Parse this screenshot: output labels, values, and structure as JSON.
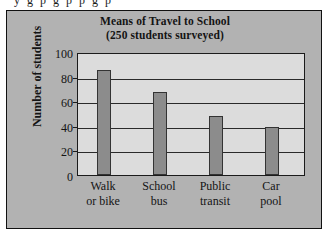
{
  "page": {
    "cut_off_text_above": "y    g  p     g  p     p   g  p"
  },
  "figure": {
    "title": "Means of Travel to School",
    "subtitle": "(250 students surveyed)",
    "background_color": "#b2b2b2",
    "plot_background_color": "#dcdcdc",
    "bar_color": "#8c8c8c",
    "axis_color": "#1b1b1b"
  },
  "axes": {
    "y_title": "Number of students",
    "y_ticks": [
      "0",
      "20",
      "40",
      "60",
      "80",
      "100"
    ],
    "y_min": 0,
    "y_max": 100
  },
  "chart_data": {
    "type": "bar",
    "title": "Means of Travel to School",
    "subtitle": "(250 students surveyed)",
    "categories": [
      "Walk or bike",
      "School bus",
      "Public transit",
      "Car pool"
    ],
    "category_lines": [
      [
        "Walk",
        "or bike"
      ],
      [
        "School",
        "bus"
      ],
      [
        "Public",
        "transit"
      ],
      [
        "Car",
        "pool"
      ]
    ],
    "values": [
      89,
      70,
      50,
      41
    ],
    "xlabel": "",
    "ylabel": "Number of students",
    "ylim": [
      0,
      100
    ],
    "ytick_values": [
      0,
      20,
      40,
      60,
      80,
      100
    ],
    "grid": true,
    "grid_axis": "y",
    "legend": false
  }
}
